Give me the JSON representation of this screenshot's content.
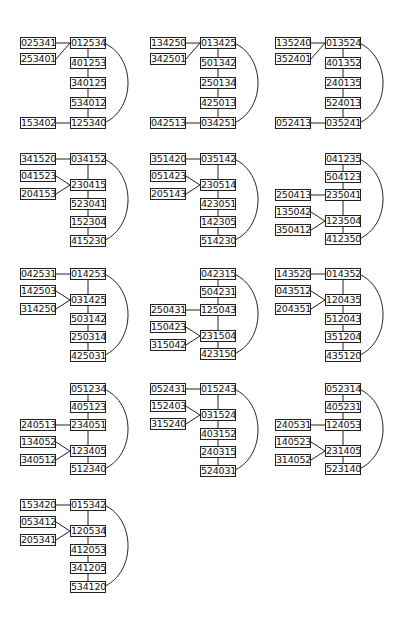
{
  "diagrams": [
    {
      "origin": [
        20,
        37
      ],
      "center": [
        "012534",
        "401253",
        "340125",
        "534012",
        "125340"
      ],
      "center_start_row": 0,
      "left": [
        {
          "label": "025341",
          "row": 0
        },
        {
          "label": "253401",
          "row": 1
        },
        {
          "label": "153402",
          "row": 5
        }
      ],
      "links": [
        [
          0,
          0
        ],
        [
          1,
          0
        ],
        [
          2,
          4
        ]
      ],
      "arc": [
        0,
        4
      ]
    },
    {
      "origin": [
        150,
        37
      ],
      "center": [
        "013425",
        "501342",
        "250134",
        "425013",
        "034251"
      ],
      "center_start_row": 0,
      "left": [
        {
          "label": "134250",
          "row": 0
        },
        {
          "label": "342501",
          "row": 1
        },
        {
          "label": "042513",
          "row": 5
        }
      ],
      "links": [
        [
          0,
          0
        ],
        [
          1,
          0
        ],
        [
          2,
          4
        ]
      ],
      "arc": [
        0,
        4
      ]
    },
    {
      "origin": [
        275,
        37
      ],
      "center": [
        "013524",
        "401352",
        "240135",
        "524013",
        "035241"
      ],
      "center_start_row": 0,
      "left": [
        {
          "label": "135240",
          "row": 0
        },
        {
          "label": "352401",
          "row": 1
        },
        {
          "label": "052413",
          "row": 5
        }
      ],
      "links": [
        [
          0,
          0
        ],
        [
          1,
          0
        ],
        [
          2,
          4
        ]
      ],
      "arc": [
        0,
        4
      ]
    },
    {
      "origin": [
        20,
        153
      ],
      "center": [
        "034152",
        "230415",
        "523041",
        "152304",
        "415230"
      ],
      "center_start_row": 0,
      "left": [
        {
          "label": "341520",
          "row": 0
        },
        {
          "label": "041523",
          "row": 1
        },
        {
          "label": "204153",
          "row": 2
        }
      ],
      "links": [
        [
          0,
          0
        ],
        [
          1,
          1
        ],
        [
          2,
          1
        ]
      ],
      "arc": [
        0,
        4
      ]
    },
    {
      "origin": [
        150,
        153
      ],
      "center": [
        "035142",
        "230514",
        "423051",
        "142305",
        "514230"
      ],
      "center_start_row": 0,
      "left": [
        {
          "label": "351420",
          "row": 0
        },
        {
          "label": "051423",
          "row": 1
        },
        {
          "label": "205143",
          "row": 2
        }
      ],
      "links": [
        [
          0,
          0
        ],
        [
          1,
          1
        ],
        [
          2,
          1
        ]
      ],
      "arc": [
        0,
        4
      ]
    },
    {
      "origin": [
        275,
        153
      ],
      "center": [
        "041235",
        "504123",
        "235041",
        "123504",
        "412350"
      ],
      "center_start_row": 0,
      "left": [
        {
          "label": "250413",
          "row": 2
        },
        {
          "label": "135042",
          "row": 3
        },
        {
          "label": "350412",
          "row": 4
        }
      ],
      "links": [
        [
          0,
          2
        ],
        [
          1,
          3
        ],
        [
          2,
          3
        ]
      ],
      "arc": [
        0,
        4
      ]
    },
    {
      "origin": [
        20,
        268
      ],
      "center": [
        "014253",
        "031425",
        "503142",
        "250314",
        "425031"
      ],
      "center_start_row": 0,
      "left": [
        {
          "label": "042531",
          "row": 0
        },
        {
          "label": "142503",
          "row": 1
        },
        {
          "label": "314250",
          "row": 2
        }
      ],
      "links": [
        [
          0,
          0
        ],
        [
          1,
          1
        ],
        [
          2,
          1
        ]
      ],
      "arc": [
        0,
        4
      ]
    },
    {
      "origin": [
        150,
        268
      ],
      "center": [
        "042315",
        "504231",
        "125043",
        "231504",
        "423150"
      ],
      "center_start_row": 0,
      "left": [
        {
          "label": "250431",
          "row": 2
        },
        {
          "label": "150423",
          "row": 3
        },
        {
          "label": "315042",
          "row": 4
        }
      ],
      "links": [
        [
          0,
          2
        ],
        [
          1,
          3
        ],
        [
          2,
          3
        ]
      ],
      "arc": [
        0,
        4
      ]
    },
    {
      "origin": [
        275,
        268
      ],
      "center": [
        "014352",
        "120435",
        "512043",
        "351204",
        "435120"
      ],
      "center_start_row": 0,
      "left": [
        {
          "label": "143520",
          "row": 0
        },
        {
          "label": "043512",
          "row": 1
        },
        {
          "label": "204351",
          "row": 2
        }
      ],
      "links": [
        [
          0,
          0
        ],
        [
          1,
          1
        ],
        [
          2,
          1
        ]
      ],
      "arc": [
        0,
        4
      ]
    },
    {
      "origin": [
        20,
        383
      ],
      "center": [
        "051234",
        "405123",
        "234051",
        "123405",
        "512340"
      ],
      "center_start_row": 0,
      "left": [
        {
          "label": "240513",
          "row": 2
        },
        {
          "label": "134052",
          "row": 3
        },
        {
          "label": "340512",
          "row": 4
        }
      ],
      "links": [
        [
          0,
          2
        ],
        [
          1,
          3
        ],
        [
          2,
          3
        ]
      ],
      "arc": [
        0,
        4
      ]
    },
    {
      "origin": [
        150,
        383
      ],
      "center": [
        "015243",
        "031524",
        "403152",
        "240315",
        "524031"
      ],
      "center_start_row": 0,
      "left": [
        {
          "label": "052431",
          "row": 0
        },
        {
          "label": "152403",
          "row": 1
        },
        {
          "label": "315240",
          "row": 2
        }
      ],
      "links": [
        [
          0,
          0
        ],
        [
          1,
          1
        ],
        [
          2,
          1
        ]
      ],
      "arc": [
        0,
        4
      ]
    },
    {
      "origin": [
        275,
        383
      ],
      "center": [
        "052314",
        "405231",
        "124053",
        "231405",
        "523140"
      ],
      "center_start_row": 0,
      "left": [
        {
          "label": "240531",
          "row": 2
        },
        {
          "label": "140523",
          "row": 3
        },
        {
          "label": "314052",
          "row": 4
        }
      ],
      "links": [
        [
          0,
          2
        ],
        [
          1,
          3
        ],
        [
          2,
          3
        ]
      ],
      "arc": [
        0,
        4
      ]
    },
    {
      "origin": [
        20,
        499
      ],
      "center": [
        "015342",
        "120534",
        "412053",
        "341205",
        "534120"
      ],
      "center_start_row": 0,
      "left": [
        {
          "label": "153420",
          "row": 0
        },
        {
          "label": "053412",
          "row": 1
        },
        {
          "label": "205341",
          "row": 2
        }
      ],
      "links": [
        [
          0,
          0
        ],
        [
          1,
          1
        ],
        [
          2,
          1
        ]
      ],
      "arc": [
        0,
        4
      ]
    }
  ]
}
